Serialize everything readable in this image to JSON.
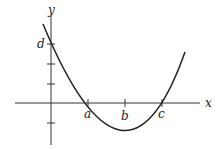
{
  "diagram": {
    "axes": {
      "x_label": "x",
      "y_label": "y"
    },
    "points": {
      "a": "a",
      "b": "b",
      "c": "c",
      "d": "d"
    },
    "curve": "parabola",
    "colors": {
      "curve": "#222222",
      "axis": "#333333"
    }
  }
}
